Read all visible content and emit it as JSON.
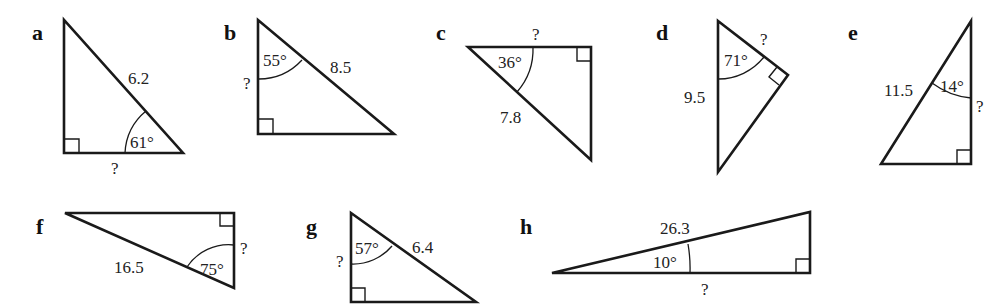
{
  "figure": {
    "triangles": [
      {
        "label": "a",
        "angle": "61°",
        "known_side": "6.2",
        "unknown": "?"
      },
      {
        "label": "b",
        "angle": "55°",
        "known_side": "8.5",
        "unknown": "?"
      },
      {
        "label": "c",
        "angle": "36°",
        "known_side": "7.8",
        "unknown": "?"
      },
      {
        "label": "d",
        "angle": "71°",
        "known_side": "9.5",
        "unknown": "?"
      },
      {
        "label": "e",
        "angle": "14°",
        "known_side": "11.5",
        "unknown": "?"
      },
      {
        "label": "f",
        "angle": "75°",
        "known_side": "16.5",
        "unknown": "?"
      },
      {
        "label": "g",
        "angle": "57°",
        "known_side": "6.4",
        "unknown": "?"
      },
      {
        "label": "h",
        "angle": "10°",
        "known_side": "26.3",
        "unknown": "?"
      }
    ]
  }
}
